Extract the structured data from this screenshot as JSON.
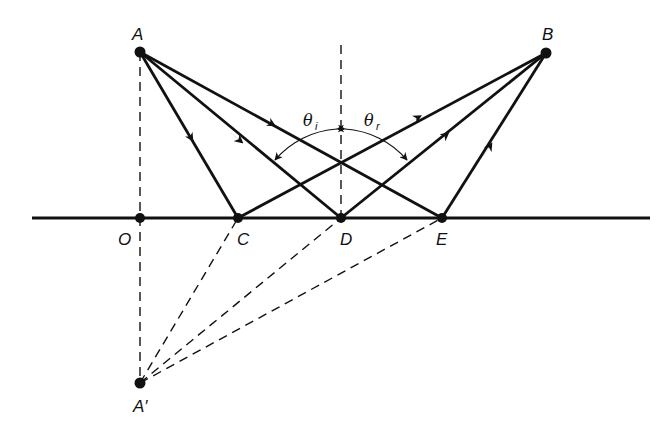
{
  "figure": {
    "type": "ray-optics-reflection",
    "colors": {
      "ink": "#111111",
      "background": "#ffffff"
    },
    "points": {
      "A": {
        "label": "A",
        "x": 140,
        "y": 52
      },
      "B": {
        "label": "B",
        "x": 546,
        "y": 53
      },
      "O": {
        "label": "O",
        "x": 140,
        "y": 218
      },
      "C": {
        "label": "C",
        "x": 238,
        "y": 218
      },
      "D": {
        "label": "D",
        "x": 341,
        "y": 218
      },
      "E": {
        "label": "E",
        "x": 442,
        "y": 218
      },
      "Ap": {
        "label": "A′",
        "x": 140,
        "y": 383
      }
    },
    "angles": {
      "incidence": {
        "symbol": "θ",
        "subscript": "i"
      },
      "reflection": {
        "symbol": "θ",
        "subscript": "r"
      }
    },
    "surface": {
      "x1": 32,
      "x2": 650,
      "y": 218
    },
    "rays_solid": [
      {
        "from": "A",
        "to": "C",
        "arrow": "toward-end"
      },
      {
        "from": "A",
        "to": "D",
        "arrow": "toward-end"
      },
      {
        "from": "A",
        "to": "E",
        "arrow": "toward-end"
      },
      {
        "from": "C",
        "to": "B",
        "arrow": "toward-end"
      },
      {
        "from": "D",
        "to": "B",
        "arrow": "toward-end"
      },
      {
        "from": "E",
        "to": "B",
        "arrow": "toward-end"
      }
    ],
    "lines_dashed": [
      {
        "from": "A",
        "to": "Ap",
        "meaning": "perpendicular through mirror point O"
      },
      {
        "from": "Ap",
        "to": "C"
      },
      {
        "from": "Ap",
        "to": "D"
      },
      {
        "from": "Ap",
        "to": "E"
      },
      {
        "meaning": "normal at D",
        "x": 341,
        "y1": 45,
        "y2": 218
      }
    ]
  }
}
